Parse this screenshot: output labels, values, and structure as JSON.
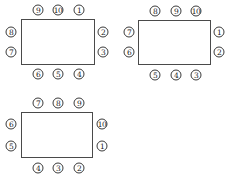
{
  "diagrams": [
    {
      "name": "arrangement-1",
      "rect": {
        "x": 21,
        "y": 19,
        "w": 74,
        "h": 46
      },
      "seats": [
        {
          "label": "⑨",
          "x": 38,
          "y": 10
        },
        {
          "label": "⑩",
          "x": 58,
          "y": 10
        },
        {
          "label": "①",
          "x": 79,
          "y": 10
        },
        {
          "label": "⑧",
          "x": 11,
          "y": 32
        },
        {
          "label": "⑦",
          "x": 11,
          "y": 52
        },
        {
          "label": "②",
          "x": 103,
          "y": 32
        },
        {
          "label": "③",
          "x": 103,
          "y": 52
        },
        {
          "label": "⑥",
          "x": 38,
          "y": 74
        },
        {
          "label": "⑤",
          "x": 58,
          "y": 74
        },
        {
          "label": "④",
          "x": 79,
          "y": 74
        }
      ]
    },
    {
      "name": "arrangement-2",
      "rect": {
        "x": 138,
        "y": 20,
        "w": 73,
        "h": 45
      },
      "seats": [
        {
          "label": "⑧",
          "x": 155,
          "y": 11
        },
        {
          "label": "⑨",
          "x": 176,
          "y": 11
        },
        {
          "label": "⑩",
          "x": 196,
          "y": 11
        },
        {
          "label": "⑦",
          "x": 129,
          "y": 32
        },
        {
          "label": "⑥",
          "x": 129,
          "y": 52
        },
        {
          "label": "①",
          "x": 219,
          "y": 32
        },
        {
          "label": "②",
          "x": 219,
          "y": 52
        },
        {
          "label": "⑤",
          "x": 155,
          "y": 75
        },
        {
          "label": "④",
          "x": 176,
          "y": 75
        },
        {
          "label": "③",
          "x": 196,
          "y": 75
        }
      ]
    },
    {
      "name": "arrangement-3",
      "rect": {
        "x": 21,
        "y": 112,
        "w": 72,
        "h": 46
      },
      "seats": [
        {
          "label": "⑦",
          "x": 38,
          "y": 103
        },
        {
          "label": "⑧",
          "x": 58,
          "y": 103
        },
        {
          "label": "⑨",
          "x": 79,
          "y": 103
        },
        {
          "label": "⑥",
          "x": 11,
          "y": 124
        },
        {
          "label": "⑤",
          "x": 11,
          "y": 146
        },
        {
          "label": "⑩",
          "x": 102,
          "y": 124
        },
        {
          "label": "①",
          "x": 102,
          "y": 146
        },
        {
          "label": "④",
          "x": 38,
          "y": 168
        },
        {
          "label": "③",
          "x": 58,
          "y": 168
        },
        {
          "label": "②",
          "x": 79,
          "y": 168
        }
      ]
    }
  ]
}
